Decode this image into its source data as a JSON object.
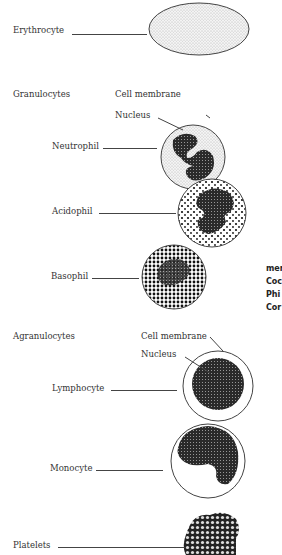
{
  "diagram": {
    "erythrocyte": {
      "label": "Erythrocyte"
    },
    "granulocytes": {
      "heading": "Granulocytes",
      "cell_membrane_label": "Cell membrane",
      "nucleus_label": "Nucleus",
      "neutrophil": "Neutrophil",
      "acidophil": "Acidophil",
      "basophil": "Basophil"
    },
    "agranulocytes": {
      "heading": "Agranulocytes",
      "cell_membrane_label": "Cell membrane",
      "nucleus_label": "Nucleus",
      "lymphocyte": "Lymphocyte",
      "monocyte": "Monocyte"
    },
    "platelets": {
      "label": "Platelets"
    },
    "clipped_text": [
      "mer",
      "Coc",
      "Phi",
      "Cor"
    ]
  }
}
